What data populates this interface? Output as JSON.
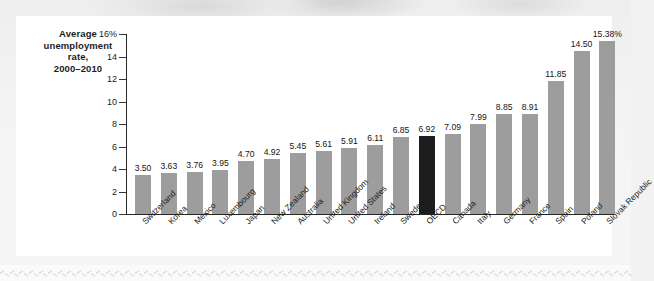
{
  "figure": {
    "axis_title_lines": [
      "Average",
      "unemployment",
      "rate,",
      "2000–2010"
    ],
    "background_color": "#f2f2f2",
    "card_color": "#ffffff",
    "bar_color": "#9d9d9d",
    "highlight_color": "#1d1d1d",
    "axis_color": "#262626"
  },
  "chart_data": {
    "type": "bar",
    "title": "Average unemployment rate, 2000–2010",
    "xlabel": "",
    "ylabel": "Average unemployment rate, 2000–2010",
    "ylim": [
      0,
      16
    ],
    "ytick_labels": [
      "16%",
      "14",
      "12",
      "10",
      "8",
      "6",
      "4",
      "2",
      "0"
    ],
    "yticks": [
      16,
      14,
      12,
      10,
      8,
      6,
      4,
      2,
      0
    ],
    "grid": false,
    "legend": null,
    "highlight_category": "OECD",
    "categories": [
      "Switzerland",
      "Korea",
      "Mexico",
      "Luxembourg",
      "Japan",
      "New Zealand",
      "Australia",
      "United Kingdom",
      "United States",
      "Ireland",
      "Sweden",
      "OECD",
      "Canada",
      "Italy",
      "Germany",
      "France",
      "Spain",
      "Poland",
      "Slovak Republic"
    ],
    "values": [
      3.5,
      3.63,
      3.76,
      3.95,
      4.7,
      4.92,
      5.45,
      5.61,
      5.91,
      6.11,
      6.85,
      6.92,
      7.09,
      7.99,
      8.85,
      8.91,
      11.85,
      14.5,
      15.38
    ],
    "data_labels": [
      "3.50",
      "3.63",
      "3.76",
      "3.95",
      "4.70",
      "4.92",
      "5.45",
      "5.61",
      "5.91",
      "6.11",
      "6.85",
      "6.92",
      "7.09",
      "7.99",
      "8.85",
      "8.91",
      "11.85",
      "14.50",
      "15.38%"
    ]
  }
}
